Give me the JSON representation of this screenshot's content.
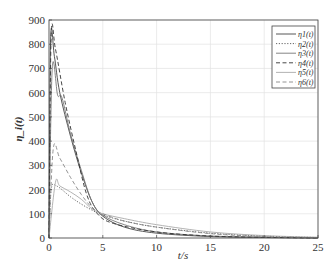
{
  "chart_data": {
    "type": "line",
    "title": "",
    "xlabel": "t/s",
    "ylabel": "η_i(t)",
    "xlim": [
      0,
      25
    ],
    "ylim": [
      0,
      900
    ],
    "xticks": [
      0,
      5,
      10,
      15,
      20,
      25
    ],
    "yticks": [
      0,
      100,
      200,
      300,
      400,
      500,
      600,
      700,
      800,
      900
    ],
    "grid": true,
    "legend_position": "upper right",
    "series": [
      {
        "name": "η1(t)",
        "style": "solid",
        "color": "#444444",
        "x": [
          0,
          0.15,
          0.5,
          1,
          2,
          3,
          4,
          5,
          7,
          10,
          15,
          20,
          25
        ],
        "y": [
          0,
          820,
          750,
          600,
          420,
          270,
          150,
          90,
          45,
          20,
          6,
          2,
          0
        ]
      },
      {
        "name": "η2(t)",
        "style": "dotted",
        "color": "#555555",
        "x": [
          0,
          0.2,
          0.7,
          2,
          3,
          4,
          5,
          7,
          10,
          15,
          20,
          25
        ],
        "y": [
          0,
          200,
          215,
          170,
          140,
          115,
          95,
          70,
          45,
          20,
          8,
          2
        ]
      },
      {
        "name": "η3(t)",
        "style": "solid",
        "color": "#777777",
        "x": [
          0,
          0.3,
          0.8,
          1.2,
          2,
          3,
          4,
          5,
          7,
          10,
          15,
          20,
          25
        ],
        "y": [
          0,
          700,
          590,
          580,
          430,
          280,
          150,
          95,
          55,
          25,
          8,
          3,
          0
        ]
      },
      {
        "name": "η4(t)",
        "style": "dashed",
        "color": "#333333",
        "x": [
          0,
          0.2,
          0.6,
          1.5,
          2.5,
          3.5,
          4.5,
          6,
          10,
          15,
          20,
          25
        ],
        "y": [
          0,
          830,
          780,
          560,
          360,
          180,
          100,
          60,
          25,
          8,
          3,
          0
        ]
      },
      {
        "name": "η5(t)",
        "style": "solid",
        "color": "#aaaaaa",
        "x": [
          0,
          0.6,
          1,
          2,
          3,
          4,
          5,
          7,
          10,
          15,
          20,
          25
        ],
        "y": [
          0,
          230,
          215,
          190,
          160,
          120,
          100,
          80,
          55,
          25,
          10,
          3
        ]
      },
      {
        "name": "η6(t)",
        "style": "dashed",
        "color": "#888888",
        "x": [
          0,
          0.4,
          1,
          2,
          3,
          4,
          5,
          7,
          10,
          15,
          20,
          25
        ],
        "y": [
          0,
          370,
          330,
          250,
          180,
          125,
          100,
          70,
          45,
          18,
          6,
          1
        ]
      }
    ]
  },
  "legend": {
    "items": [
      "η1(t)",
      "η2(t)",
      "η3(t)",
      "η4(t)",
      "η5(t)",
      "η6(t)"
    ]
  }
}
